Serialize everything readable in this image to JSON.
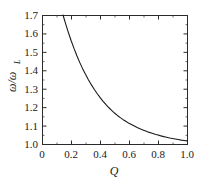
{
  "chart_data": {
    "type": "line",
    "title": "",
    "subtitle": "",
    "xlabel": "Q",
    "ylabel": "ω/ω",
    "ylabel_sub": "L",
    "xlim": [
      0.0,
      1.0
    ],
    "ylim": [
      1.0,
      1.7
    ],
    "grid": false,
    "legend": null,
    "x_ticks": [
      "0",
      "0.2",
      "0.4",
      "0.6",
      "0.8",
      "1.0"
    ],
    "x_tick_values": [
      0.0,
      0.2,
      0.4,
      0.6,
      0.8,
      1.0
    ],
    "y_ticks": [
      "1.0",
      "1.1",
      "1.2",
      "1.3",
      "1.4",
      "1.5",
      "1.6",
      "1.7"
    ],
    "y_tick_values": [
      1.0,
      1.1,
      1.2,
      1.3,
      1.4,
      1.5,
      1.6,
      1.7
    ],
    "x_minor_count": 1,
    "y_minor_count": 1,
    "series": [
      {
        "name": "omega-ratio",
        "x": [
          0.145,
          0.16,
          0.18,
          0.2,
          0.22,
          0.24,
          0.26,
          0.28,
          0.3,
          0.32,
          0.34,
          0.36,
          0.38,
          0.4,
          0.42,
          0.44,
          0.46,
          0.48,
          0.5,
          0.52,
          0.54,
          0.56,
          0.58,
          0.6,
          0.62,
          0.64,
          0.66,
          0.68,
          0.7,
          0.72,
          0.74,
          0.76,
          0.78,
          0.8,
          0.82,
          0.84,
          0.86,
          0.88,
          0.9,
          0.92,
          0.94,
          0.96,
          0.98,
          1.0
        ],
        "y": [
          1.7,
          1.66,
          1.61,
          1.563,
          1.52,
          1.48,
          1.443,
          1.409,
          1.378,
          1.349,
          1.322,
          1.297,
          1.274,
          1.253,
          1.233,
          1.215,
          1.198,
          1.182,
          1.168,
          1.155,
          1.143,
          1.132,
          1.122,
          1.112,
          1.104,
          1.096,
          1.088,
          1.081,
          1.075,
          1.069,
          1.063,
          1.058,
          1.053,
          1.049,
          1.044,
          1.04,
          1.037,
          1.033,
          1.03,
          1.027,
          1.024,
          1.021,
          1.019,
          1.017
        ]
      }
    ]
  },
  "figure": {
    "plot_left": 42,
    "plot_top": 15,
    "plot_right": 187,
    "plot_bottom": 144
  }
}
